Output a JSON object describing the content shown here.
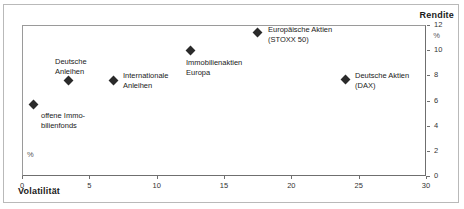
{
  "figure": {
    "title_clipped": "",
    "rendite_axis_title": "Rendite",
    "volatilitaet_axis_title": "Volatilität",
    "percent_symbol_right": "%",
    "percent_symbol_left": "%"
  },
  "chart_data": {
    "type": "scatter",
    "title": "",
    "xlabel": "Volatilität",
    "ylabel": "Rendite",
    "xunit": "%",
    "yunit": "%",
    "xlim": [
      0,
      30
    ],
    "ylim": [
      0,
      12
    ],
    "xticks": [
      "0",
      "5",
      "10",
      "15",
      "20",
      "25",
      "30"
    ],
    "yticks": [
      "0",
      "2",
      "4",
      "6",
      "8",
      "10",
      "12"
    ],
    "yaxis_position": "right",
    "grid": false,
    "legend": "none",
    "marker_color": "#2b2b2b",
    "points": [
      {
        "label_lines": [
          "offene Immo-",
          "bilienfonds"
        ],
        "x": 0.8,
        "y": 5.7,
        "px": 33,
        "py": 104,
        "label_px": 41,
        "label_py": 111
      },
      {
        "label_lines": [
          "Deutsche",
          "Anleihen"
        ],
        "x": 3.4,
        "y": 7.6,
        "px": 68,
        "py": 80,
        "label_px": 55,
        "label_py": 57
      },
      {
        "label_lines": [
          "Internationale",
          "Anleihen"
        ],
        "x": 6.8,
        "y": 7.6,
        "px": 113,
        "py": 80,
        "label_px": 123,
        "label_py": 71
      },
      {
        "label_lines": [
          "Immobilienaktien",
          "Europa"
        ],
        "x": 12.5,
        "y": 10.0,
        "px": 190,
        "py": 50,
        "label_px": 186,
        "label_py": 58
      },
      {
        "label_lines": [
          "Europäische Aktien",
          "(STOXX 50)"
        ],
        "x": 17.5,
        "y": 11.4,
        "px": 257,
        "py": 32,
        "label_px": 268,
        "label_py": 25
      },
      {
        "label_lines": [
          "Deutsche Aktien",
          "(DAX)"
        ],
        "x": 24.0,
        "y": 7.7,
        "px": 345,
        "py": 79,
        "label_px": 355,
        "label_py": 71
      }
    ]
  }
}
